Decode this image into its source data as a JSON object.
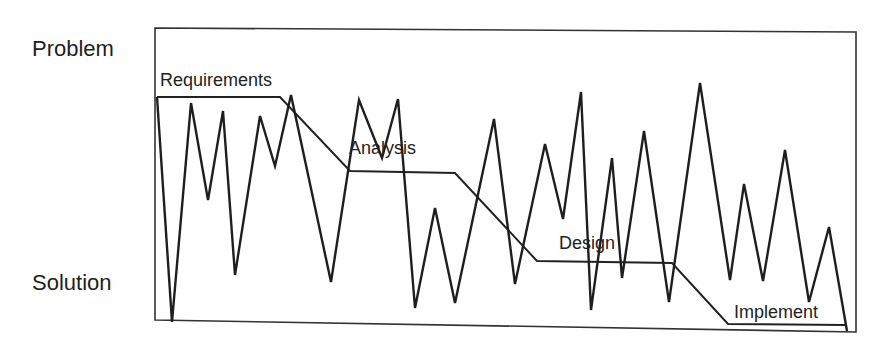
{
  "axis": {
    "top_label": "Problem",
    "bottom_label": "Solution"
  },
  "phases": [
    {
      "label": "Requirements",
      "x": 160,
      "y": 86
    },
    {
      "label": "Analysis",
      "x": 349,
      "y": 154
    },
    {
      "label": "Design",
      "x": 559,
      "y": 249
    },
    {
      "label": "Implement",
      "x": 734,
      "y": 318
    }
  ],
  "colors": {
    "line": "#222222",
    "frame": "#333333",
    "background": "#ffffff"
  },
  "frame": {
    "x1": 155,
    "y1": 28,
    "x2": 856,
    "y2": 332
  },
  "staircase_points": "157,97 280,97 350,171 455,173 537,261 672,263 728,324 845,325",
  "zigzag_points": "157,97 172,322 191,103 208,200 223,111 235,275 260,116 275,166 291,95 331,282 359,100 382,158 398,99 415,308 435,208 455,303 494,119 515,284 545,144 563,219 581,92 591,310 612,158 622,278 644,131 669,302 700,83 730,280 744,184 763,281 785,150 809,302 829,227 847,331"
}
